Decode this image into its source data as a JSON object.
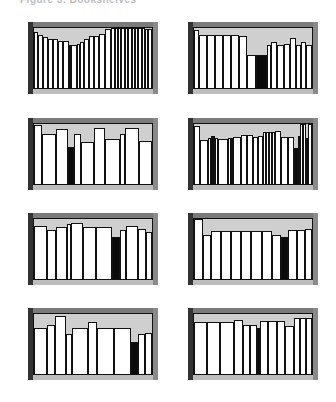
{
  "caption": "Figure 3. Bookshelves",
  "colors": {
    "frame": "#555555",
    "background_stipple": "#cfcfcf",
    "book": "#ffffff",
    "dark_book": "#0b0b0b",
    "outline": "#111111"
  },
  "panels": [
    {
      "id": "p1",
      "left": 28,
      "top": 22,
      "books": [
        [
          5,
          93
        ],
        [
          6,
          88
        ],
        [
          5,
          85
        ],
        [
          6,
          82
        ],
        [
          6,
          82
        ],
        [
          6,
          79
        ],
        [
          7,
          78
        ],
        [
          2,
          72
        ],
        [
          7,
          72
        ],
        [
          3,
          74
        ],
        [
          5,
          76
        ],
        [
          6,
          82
        ],
        [
          6,
          86
        ],
        [
          6,
          86
        ],
        [
          7,
          90
        ],
        [
          7,
          98
        ],
        [
          4,
          100
        ],
        [
          4,
          100
        ],
        [
          4,
          100
        ],
        [
          4,
          100
        ],
        [
          4,
          100
        ],
        [
          4,
          100
        ],
        [
          4,
          100
        ],
        [
          4,
          100
        ],
        [
          4,
          100
        ],
        [
          4,
          100
        ],
        [
          3,
          98
        ],
        [
          5,
          98
        ]
      ],
      "dark_index": 7
    },
    {
      "id": "p2",
      "left": 188,
      "top": 22,
      "books": [
        [
          5,
          96
        ],
        [
          9,
          89
        ],
        [
          9,
          89
        ],
        [
          9,
          89
        ],
        [
          9,
          89
        ],
        [
          9,
          89
        ],
        [
          8,
          86
        ],
        [
          10,
          55
        ],
        [
          13,
          55
        ],
        [
          4,
          72
        ],
        [
          7,
          77
        ],
        [
          7,
          72
        ],
        [
          7,
          74
        ],
        [
          7,
          83
        ],
        [
          5,
          72
        ],
        [
          6,
          77
        ],
        [
          6,
          72
        ]
      ],
      "dark_index": 8
    },
    {
      "id": "p3",
      "left": 28,
      "top": 118,
      "books": [
        [
          8,
          98
        ],
        [
          14,
          83
        ],
        [
          13,
          91
        ],
        [
          6,
          62
        ],
        [
          7,
          84
        ],
        [
          13,
          70
        ],
        [
          11,
          94
        ],
        [
          15,
          75
        ],
        [
          6,
          84
        ],
        [
          14,
          94
        ],
        [
          13,
          72
        ]
      ],
      "dark_index": 3
    },
    {
      "id": "p4",
      "left": 188,
      "top": 118,
      "books": [
        [
          6,
          96
        ],
        [
          8,
          74
        ],
        [
          3,
          76
        ],
        [
          3,
          80
        ],
        [
          2,
          80
        ],
        [
          3,
          77
        ],
        [
          10,
          75
        ],
        [
          3,
          77
        ],
        [
          2,
          77
        ],
        [
          8,
          79
        ],
        [
          6,
          81
        ],
        [
          6,
          81
        ],
        [
          6,
          79
        ],
        [
          5,
          80
        ],
        [
          3,
          86
        ],
        [
          3,
          86
        ],
        [
          3,
          86
        ],
        [
          3,
          86
        ],
        [
          6,
          88
        ],
        [
          7,
          79
        ],
        [
          7,
          79
        ],
        [
          4,
          60
        ],
        [
          2,
          80
        ],
        [
          3,
          100
        ],
        [
          3,
          100
        ],
        [
          2,
          76
        ],
        [
          4,
          100
        ]
      ],
      "dark_index": 21
    },
    {
      "id": "p5",
      "left": 28,
      "top": 213,
      "books": [
        [
          14,
          88
        ],
        [
          10,
          82
        ],
        [
          11,
          86
        ],
        [
          5,
          91
        ],
        [
          12,
          94
        ],
        [
          14,
          86
        ],
        [
          17,
          86
        ],
        [
          9,
          70
        ],
        [
          6,
          81
        ],
        [
          13,
          88
        ],
        [
          9,
          84
        ],
        [
          6,
          79
        ]
      ],
      "dark_index": 7
    },
    {
      "id": "p6",
      "left": 188,
      "top": 213,
      "books": [
        [
          9,
          100
        ],
        [
          8,
          74
        ],
        [
          10,
          80
        ],
        [
          10,
          80
        ],
        [
          10,
          80
        ],
        [
          10,
          80
        ],
        [
          10,
          80
        ],
        [
          10,
          80
        ],
        [
          9,
          74
        ],
        [
          7,
          70
        ],
        [
          9,
          82
        ],
        [
          8,
          82
        ],
        [
          7,
          84
        ]
      ],
      "dark_index": 9
    },
    {
      "id": "p7",
      "left": 28,
      "top": 308,
      "books": [
        [
          13,
          76
        ],
        [
          9,
          82
        ],
        [
          11,
          97
        ],
        [
          6,
          66
        ],
        [
          16,
          76
        ],
        [
          10,
          86
        ],
        [
          17,
          76
        ],
        [
          18,
          76
        ],
        [
          7,
          54
        ],
        [
          7,
          67
        ],
        [
          7,
          68
        ]
      ],
      "dark_index": 8
    },
    {
      "id": "p8",
      "left": 188,
      "top": 308,
      "books": [
        [
          13,
          86
        ],
        [
          13,
          86
        ],
        [
          13,
          86
        ],
        [
          9,
          90
        ],
        [
          7,
          82
        ],
        [
          7,
          82
        ],
        [
          3,
          76
        ],
        [
          8,
          88
        ],
        [
          9,
          88
        ],
        [
          8,
          88
        ],
        [
          8,
          80
        ],
        [
          6,
          94
        ],
        [
          6,
          94
        ],
        [
          6,
          94
        ]
      ],
      "dark_index": 6
    }
  ]
}
